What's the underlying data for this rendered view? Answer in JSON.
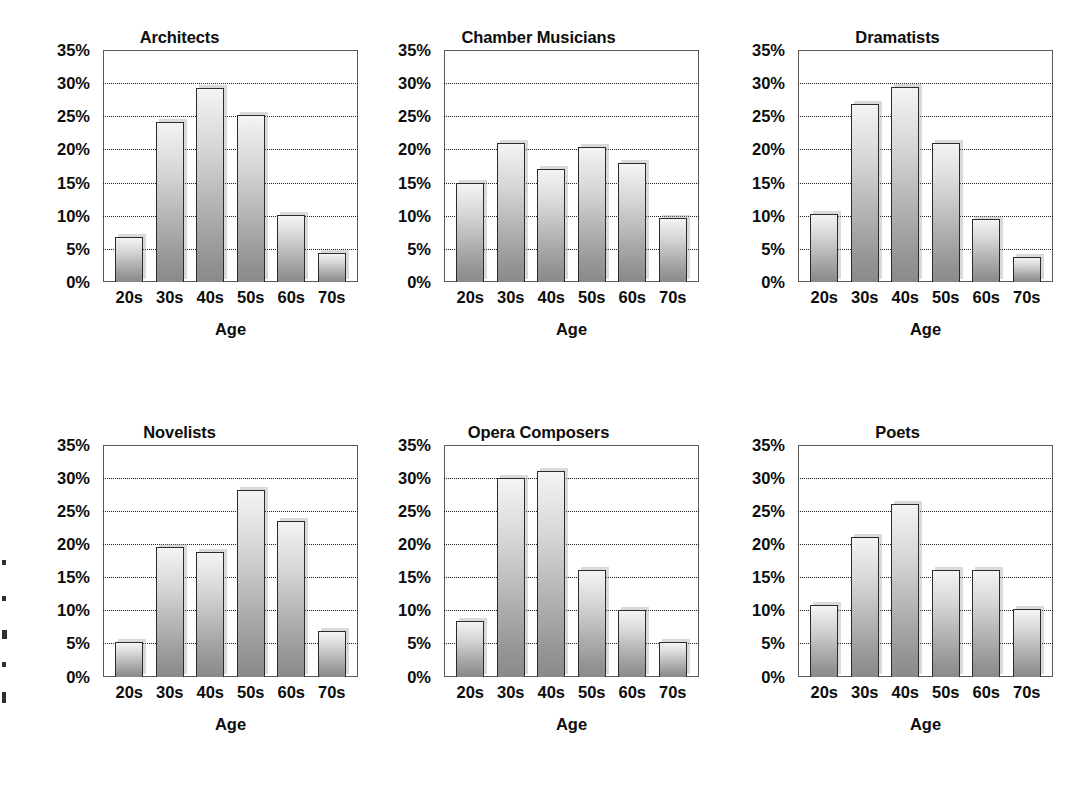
{
  "chart_data": [
    {
      "type": "bar",
      "title": "Architects",
      "xlabel": "Age",
      "ylabel": "",
      "categories": [
        "20s",
        "30s",
        "40s",
        "50s",
        "60s",
        "70s"
      ],
      "values": [
        6.8,
        24.2,
        29.3,
        25.2,
        10.1,
        4.4
      ],
      "ylim": [
        0,
        35
      ],
      "yticks": [
        0,
        5,
        10,
        15,
        20,
        25,
        30,
        35
      ],
      "ytick_labels": [
        "0%",
        "5%",
        "10%",
        "15%",
        "20%",
        "25%",
        "30%",
        "35%"
      ],
      "gridlines_at": [
        5,
        10,
        15,
        20,
        25,
        30
      ],
      "grid": true,
      "legend": "none"
    },
    {
      "type": "bar",
      "title": "Chamber Musicians",
      "xlabel": "Age",
      "ylabel": "",
      "categories": [
        "20s",
        "30s",
        "40s",
        "50s",
        "60s",
        "70s"
      ],
      "values": [
        15.0,
        21.0,
        17.0,
        20.3,
        18.0,
        9.6
      ],
      "ylim": [
        0,
        35
      ],
      "yticks": [
        0,
        5,
        10,
        15,
        20,
        25,
        30,
        35
      ],
      "ytick_labels": [
        "0%",
        "5%",
        "10%",
        "15%",
        "20%",
        "25%",
        "30%",
        "35%"
      ],
      "gridlines_at": [
        5,
        10,
        15,
        20,
        25,
        30
      ],
      "grid": true,
      "legend": "none"
    },
    {
      "type": "bar",
      "title": "Dramatists",
      "xlabel": "Age",
      "ylabel": "",
      "categories": [
        "20s",
        "30s",
        "40s",
        "50s",
        "60s",
        "70s"
      ],
      "values": [
        10.2,
        26.8,
        29.4,
        21.0,
        9.5,
        3.8
      ],
      "ylim": [
        0,
        35
      ],
      "yticks": [
        0,
        5,
        10,
        15,
        20,
        25,
        30,
        35
      ],
      "ytick_labels": [
        "0%",
        "5%",
        "10%",
        "15%",
        "20%",
        "25%",
        "30%",
        "35%"
      ],
      "gridlines_at": [
        5,
        10,
        15,
        20,
        25,
        30
      ],
      "grid": true,
      "legend": "none"
    },
    {
      "type": "bar",
      "title": "Novelists",
      "xlabel": "Age",
      "ylabel": "",
      "categories": [
        "20s",
        "30s",
        "40s",
        "50s",
        "60s",
        "70s"
      ],
      "values": [
        5.2,
        19.5,
        18.8,
        28.2,
        23.4,
        6.8
      ],
      "ylim": [
        0,
        35
      ],
      "yticks": [
        0,
        5,
        10,
        15,
        20,
        25,
        30,
        35
      ],
      "ytick_labels": [
        "0%",
        "5%",
        "10%",
        "15%",
        "20%",
        "25%",
        "30%",
        "35%"
      ],
      "gridlines_at": [
        5,
        10,
        15,
        20,
        25,
        30
      ],
      "grid": true,
      "legend": "none"
    },
    {
      "type": "bar",
      "title": "Opera Composers",
      "xlabel": "Age",
      "ylabel": "",
      "categories": [
        "20s",
        "30s",
        "40s",
        "50s",
        "60s",
        "70s"
      ],
      "values": [
        8.3,
        29.9,
        31.0,
        16.0,
        10.1,
        5.2
      ],
      "ylim": [
        0,
        35
      ],
      "yticks": [
        0,
        5,
        10,
        15,
        20,
        25,
        30,
        35
      ],
      "ytick_labels": [
        "0%",
        "5%",
        "10%",
        "15%",
        "20%",
        "25%",
        "30%",
        "35%"
      ],
      "gridlines_at": [
        5,
        10,
        15,
        20,
        25,
        30
      ],
      "grid": true,
      "legend": "none"
    },
    {
      "type": "bar",
      "title": "Poets",
      "xlabel": "Age",
      "ylabel": "",
      "categories": [
        "20s",
        "30s",
        "40s",
        "50s",
        "60s",
        "70s"
      ],
      "values": [
        10.8,
        21.0,
        26.0,
        16.0,
        16.0,
        10.2
      ],
      "ylim": [
        0,
        35
      ],
      "yticks": [
        0,
        5,
        10,
        15,
        20,
        25,
        30,
        35
      ],
      "ytick_labels": [
        "0%",
        "5%",
        "10%",
        "15%",
        "20%",
        "25%",
        "30%",
        "35%"
      ],
      "gridlines_at": [
        5,
        10,
        15,
        20,
        25,
        30
      ],
      "grid": true,
      "legend": "none"
    }
  ],
  "figure": {
    "layout": "2 rows x 3 columns of bar panels",
    "bar_fill_top_color": "#f4f4f4",
    "bar_fill_bottom_color": "#8a8a8a",
    "bar_outline_color": "#2b2b2b",
    "gridline_color": "#1c1c1c",
    "frame_color": "#5a5a5a",
    "text_color": "#0d0d0d",
    "background_color": "#ffffff"
  }
}
